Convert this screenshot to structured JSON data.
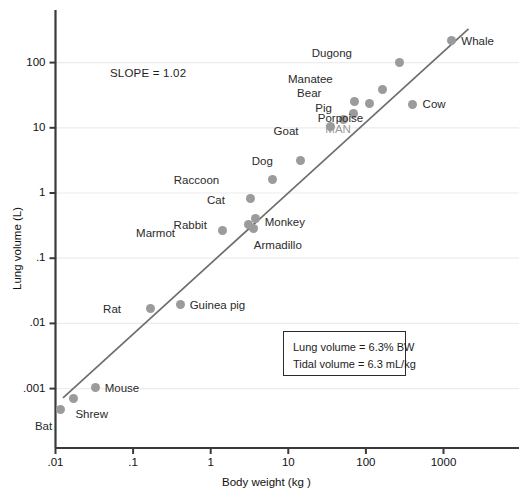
{
  "figure": {
    "slope_note": "SLOPE = 1.02",
    "axis": {
      "xlabel": "Body weight (kg )",
      "ylabel": "Lung volume (L)",
      "xticks": [
        ".01",
        ".1",
        "1",
        "10",
        "100",
        "1000"
      ],
      "yticks": [
        "100",
        "10",
        "1",
        ".1",
        ".01",
        ".001"
      ]
    },
    "legend": {
      "line1": "Lung volume = 6.3% BW",
      "line2": "Tidal volume = 6.3 mL/kg"
    }
  },
  "chart_data": {
    "type": "scatter",
    "title": "",
    "xlabel": "Body weight (kg )",
    "ylabel": "Lung volume (L)",
    "xscale": "log",
    "yscale": "log",
    "xlim": [
      0.01,
      4000
    ],
    "ylim": [
      0.0003,
      600
    ],
    "xticks": [
      0.01,
      0.1,
      1,
      10,
      100,
      1000
    ],
    "xtick_labels": [
      ".01",
      ".1",
      "1",
      "10",
      "100",
      "1000"
    ],
    "yticks": [
      0.001,
      0.01,
      0.1,
      1,
      10,
      100
    ],
    "ytick_labels": [
      ".001",
      ".01",
      ".1",
      "1",
      "10",
      "100"
    ],
    "grid": "horizontal",
    "legend_position": "none",
    "annotations": [
      "SLOPE = 1.02",
      "Lung volume = 6.3% BW",
      "Tidal volume = 6.3 mL/kg"
    ],
    "fit_line": {
      "label": "allometric regression",
      "slope": 1.02,
      "equation": "Lung volume = 6.3% BW",
      "x_start": 0.0125,
      "y_start": 0.00072,
      "x_end": 2100,
      "y_end": 330
    },
    "points": [
      {
        "name": "Bat",
        "x": 0.0115,
        "y": 0.00047,
        "label_pos": "below"
      },
      {
        "name": "Shrew",
        "x": 0.017,
        "y": 0.00071,
        "label_pos": "below-right"
      },
      {
        "name": "Mouse",
        "x": 0.033,
        "y": 0.00105,
        "label_pos": "right"
      },
      {
        "name": "Rat",
        "x": 0.17,
        "y": 0.0172,
        "label_pos": "left"
      },
      {
        "name": "Guinea pig",
        "x": 0.41,
        "y": 0.0195,
        "label_pos": "right"
      },
      {
        "name": "Marmot",
        "x": 1.4,
        "y": 0.265,
        "label_pos": "left"
      },
      {
        "name": "Rabbit",
        "x": 3.1,
        "y": 0.33,
        "label_pos": "left"
      },
      {
        "name": "Monkey",
        "x": 3.8,
        "y": 0.4,
        "label_pos": "right"
      },
      {
        "name": "Armadillo",
        "x": 3.6,
        "y": 0.285,
        "label_pos": "below-right"
      },
      {
        "name": "Cat",
        "x": 3.3,
        "y": 0.81,
        "label_pos": "left"
      },
      {
        "name": "Raccoon",
        "x": 6.2,
        "y": 1.6,
        "label_pos": "left"
      },
      {
        "name": "Dog",
        "x": 14.5,
        "y": 3.1,
        "label_pos": "left"
      },
      {
        "name": "Goat",
        "x": 35,
        "y": 10.5,
        "label_pos": "left"
      },
      {
        "name": "Pig",
        "x": 52,
        "y": 13.5,
        "label_pos": "above-left"
      },
      {
        "name": "MAN",
        "x": 70,
        "y": 16.5,
        "label_pos": "below-right"
      },
      {
        "name": "Bear",
        "x": 71,
        "y": 25,
        "label_pos": "above-left"
      },
      {
        "name": "Porpoise",
        "x": 110,
        "y": 24,
        "label_pos": "below-right"
      },
      {
        "name": "Manatee",
        "x": 165,
        "y": 38,
        "label_pos": "above-left"
      },
      {
        "name": "Cow",
        "x": 400,
        "y": 23,
        "label_pos": "right"
      },
      {
        "name": "Dugong",
        "x": 275,
        "y": 100,
        "label_pos": "above-left"
      },
      {
        "name": "Whale",
        "x": 1260,
        "y": 215,
        "label_pos": "right"
      }
    ]
  }
}
